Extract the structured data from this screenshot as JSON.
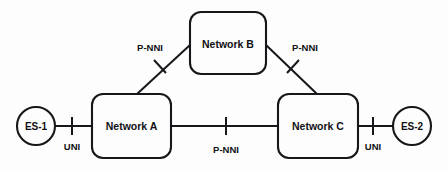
{
  "diagram": {
    "background_color": "#fdfdfd",
    "stroke_color": "#16171a",
    "nodes": [
      {
        "id": "network-b",
        "label": "Network B",
        "shape": "rounded-rect",
        "x": 190,
        "y": 12,
        "w": 76,
        "h": 62,
        "rx": 11
      },
      {
        "id": "network-a",
        "label": "Network A",
        "shape": "rounded-rect",
        "x": 92,
        "y": 94,
        "w": 79,
        "h": 64,
        "rx": 11
      },
      {
        "id": "network-c",
        "label": "Network C",
        "shape": "rounded-rect",
        "x": 278,
        "y": 94,
        "w": 80,
        "h": 64,
        "rx": 11
      }
    ],
    "endpoints": [
      {
        "id": "es-1",
        "label": "ES-1",
        "shape": "circle",
        "cx": 36,
        "cy": 126,
        "r": 19
      },
      {
        "id": "es-2",
        "label": "ES-2",
        "shape": "circle",
        "cx": 412,
        "cy": 126,
        "r": 19
      }
    ],
    "links": [
      {
        "id": "link-es1-networka",
        "from": "es-1",
        "to": "network-a",
        "x1": 55,
        "y1": 126,
        "x2": 92,
        "y2": 126,
        "interface": "UNI"
      },
      {
        "id": "link-networka-networkb",
        "from": "network-a",
        "to": "network-b",
        "x1": 137,
        "y1": 94,
        "x2": 190,
        "y2": 45,
        "interface": "P-NNI"
      },
      {
        "id": "link-networkb-networkc",
        "from": "network-b",
        "to": "network-c",
        "x1": 266,
        "y1": 45,
        "x2": 317,
        "y2": 94,
        "interface": "P-NNI"
      },
      {
        "id": "link-networka-networkc",
        "from": "network-a",
        "to": "network-c",
        "x1": 171,
        "y1": 126,
        "x2": 278,
        "y2": 126,
        "interface": "P-NNI"
      },
      {
        "id": "link-networkc-es2",
        "from": "network-c",
        "to": "es-2",
        "x1": 358,
        "y1": 126,
        "x2": 393,
        "y2": 126,
        "interface": "UNI"
      }
    ],
    "interface_markers": [
      {
        "id": "uni-left",
        "label": "UNI",
        "tick_x1": 72,
        "tick_y1": 117,
        "tick_x2": 72,
        "tick_y2": 135,
        "label_x": 72,
        "label_y": 146
      },
      {
        "id": "pnni-left",
        "label": "P-NNI",
        "tick_x1": 154,
        "tick_y1": 60,
        "tick_x2": 166,
        "tick_y2": 73,
        "label_x": 150,
        "label_y": 47
      },
      {
        "id": "pnni-right",
        "label": "P-NNI",
        "tick_x1": 287,
        "tick_y1": 73,
        "tick_x2": 299,
        "tick_y2": 60,
        "label_x": 305,
        "label_y": 47
      },
      {
        "id": "pnni-center",
        "label": "P-NNI",
        "tick_x1": 226,
        "tick_y1": 117,
        "tick_x2": 226,
        "tick_y2": 135,
        "label_x": 226,
        "label_y": 149
      },
      {
        "id": "uni-right",
        "label": "UNI",
        "tick_x1": 373,
        "tick_y1": 117,
        "tick_x2": 373,
        "tick_y2": 135,
        "label_x": 373,
        "label_y": 146
      }
    ]
  }
}
